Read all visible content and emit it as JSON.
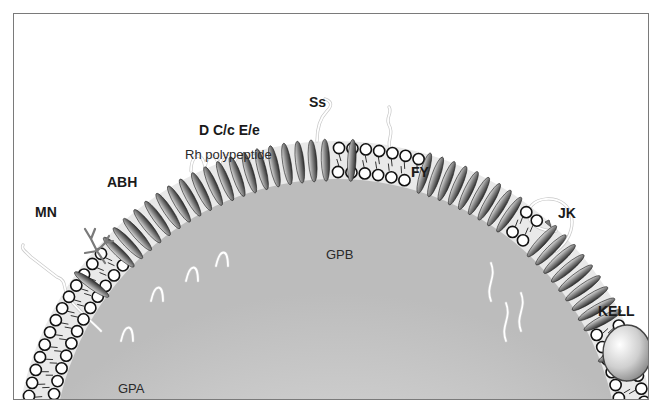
{
  "figure": {
    "colors": {
      "frame": "#7a7a7a",
      "cytoplasm_center": "#f4f4f4",
      "cytoplasm_edge": "#bdbdbd",
      "bilayer_band": "#e9e9e9",
      "bead_fill": "#ffffff",
      "bead_stroke": "#111111",
      "protein_dark": "#3a3a3a",
      "protein_light": "#d8d8d8",
      "glyco_chain": "#f2f2f2",
      "abh_branch": "#7a7a7a"
    }
  },
  "labels": {
    "mn": "MN",
    "abh": "ABH",
    "rh_antigens": "D C/c E/e",
    "rh_polypeptide": "Rh polypeptide",
    "ss": "Ss",
    "fy": "FY",
    "jk": "JK",
    "kell": "KELL",
    "gpa": "GPA",
    "gpb": "GPB"
  },
  "membrane": {
    "center_x": 335,
    "center_y": 461,
    "outer_radius": 314,
    "inner_radius": 290,
    "protein_clusters": [
      {
        "name": "GPA",
        "from_deg": -144,
        "to_deg": -143
      },
      {
        "name": "Rh cluster",
        "from_deg": -136,
        "to_deg": -92
      },
      {
        "name": "GPB",
        "from_deg": -87,
        "to_deg": -86
      },
      {
        "name": "FY cluster",
        "from_deg": -73,
        "to_deg": -55
      },
      {
        "name": "JK cluster",
        "from_deg": -47,
        "to_deg": -28
      },
      {
        "name": "KELL anchor",
        "from_deg": -21,
        "to_deg": -20
      }
    ]
  }
}
